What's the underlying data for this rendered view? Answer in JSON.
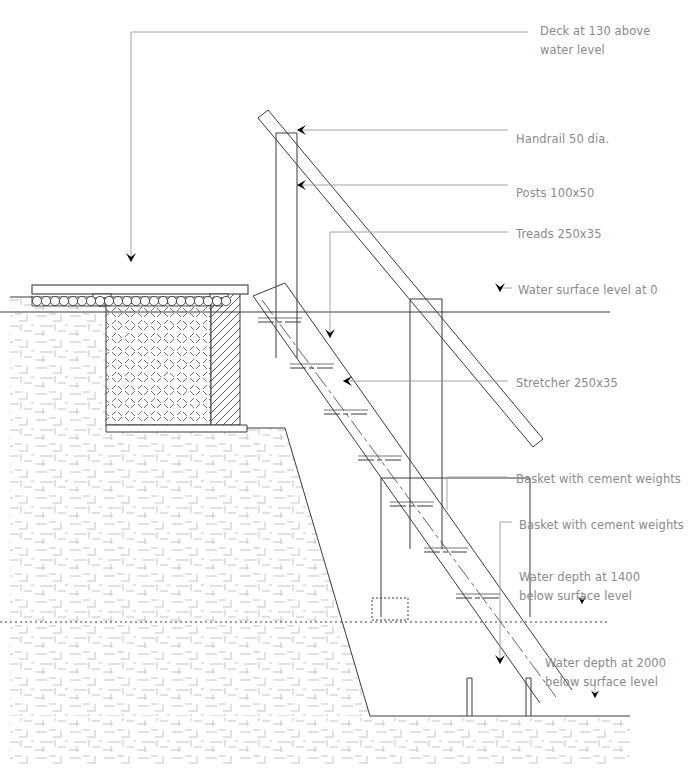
{
  "drawing": {
    "title": "Timber jetty access stair - section",
    "type": "architectural-section",
    "units": "mm",
    "line_color": "#3a3a3a",
    "label_color": "#8a8a8a",
    "leader_color": "#9a9a9a",
    "arrow_color": "#000000",
    "background": "#ffffff"
  },
  "annotations": [
    {
      "id": "deck",
      "text": "Deck at 130 above\nwater level",
      "x": 540,
      "y": 22,
      "value": 130,
      "datum": "water level"
    },
    {
      "id": "handrail",
      "text": "Handrail 50 dia.",
      "x": 516,
      "y": 130,
      "size": "50 dia."
    },
    {
      "id": "posts",
      "text": "Posts 100x50",
      "x": 516,
      "y": 184,
      "size": "100x50"
    },
    {
      "id": "treads",
      "text": "Treads 250x35",
      "x": 516,
      "y": 225,
      "size": "250x35"
    },
    {
      "id": "water-0",
      "text": "Water surface level at 0",
      "x": 518,
      "y": 282,
      "value": 0
    },
    {
      "id": "stretcher",
      "text": "Stretcher 250x35",
      "x": 516,
      "y": 375,
      "size": "250x35"
    },
    {
      "id": "basket-upper",
      "text": "Basket with cement weights",
      "x": 516,
      "y": 470
    },
    {
      "id": "basket-lower",
      "text": "Basket with cement weights",
      "x": 519,
      "y": 516
    },
    {
      "id": "depth-1400",
      "text": "Water depth at 1400\nbelow surface level",
      "x": 519,
      "y": 569,
      "value": 1400
    },
    {
      "id": "depth-2000",
      "text": "Water depth at 2000\nbelow surface level",
      "x": 545,
      "y": 655,
      "value": 2000
    }
  ],
  "levels": {
    "water_surface": {
      "label": "Water surface level at 0",
      "value": 0
    },
    "depth_1": {
      "label": "Water depth at 1400 below surface level",
      "value": 1400
    },
    "depth_2": {
      "label": "Water depth at 2000 below surface level",
      "value": 2000
    },
    "deck": {
      "label": "Deck at 130 above water level",
      "value": 130
    }
  },
  "components": [
    {
      "name": "handrail",
      "label": "Handrail 50 dia.",
      "spec": "50 dia."
    },
    {
      "name": "posts",
      "label": "Posts 100x50",
      "spec": "100x50"
    },
    {
      "name": "treads",
      "label": "Treads 250x35",
      "spec": "250x35"
    },
    {
      "name": "stretcher",
      "label": "Stretcher 250x35",
      "spec": "250x35"
    },
    {
      "name": "basket",
      "label": "Basket with cement weights",
      "spec": ""
    },
    {
      "name": "deck",
      "label": "Deck at 130 above water level",
      "spec": "130"
    }
  ]
}
